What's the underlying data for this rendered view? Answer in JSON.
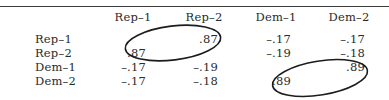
{
  "table": {
    "columns": [
      "Rep–1",
      "Rep–2",
      "Dem–1",
      "Dem–2"
    ],
    "rows": [
      {
        "label": "Rep–1",
        "values": [
          "",
          ".87",
          "–.17",
          "–.17"
        ]
      },
      {
        "label": "Rep–2",
        "values": [
          ".87",
          "",
          "–.19",
          "–.18"
        ]
      },
      {
        "label": "Dem–1",
        "values": [
          "–.17",
          "–.19",
          "",
          ".89"
        ]
      },
      {
        "label": "Dem–2",
        "values": [
          "–.17",
          "–.18",
          ".89",
          ""
        ]
      }
    ],
    "annotations": [
      {
        "type": "hand-drawn-ellipse",
        "encloses": [
          "Rep–1/Rep–2 .87",
          "Rep–2/Rep–1 .87"
        ]
      },
      {
        "type": "hand-drawn-ellipse",
        "encloses": [
          "Dem–1/Dem–2 .89",
          "Dem–2/Dem–1 .89"
        ]
      }
    ]
  }
}
